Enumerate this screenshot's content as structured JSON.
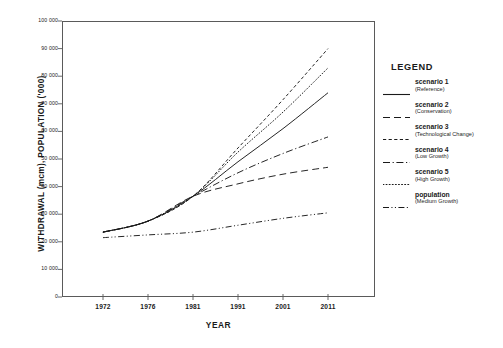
{
  "chart_data": {
    "type": "line",
    "title": "",
    "xlabel": "YEAR",
    "ylabel": "WITHDRAWAL (mcm), POPULATION ('000)",
    "x": [
      1972,
      1976,
      1981,
      1991,
      2001,
      2011
    ],
    "x_tick_labels": [
      "1972",
      "1976",
      "1981",
      "1991",
      "2001",
      "2011"
    ],
    "y_tick_labels": [
      "0",
      "10 000",
      "20 000",
      "30 000",
      "40 000",
      "50 000",
      "60 000",
      "70 000",
      "80 000",
      "90 000",
      "100 000"
    ],
    "y_tick_values": [
      0,
      10000,
      20000,
      30000,
      40000,
      50000,
      60000,
      70000,
      80000,
      90000,
      100000
    ],
    "ylim": [
      0,
      100000
    ],
    "grid": false,
    "legend_position": "right",
    "series": [
      {
        "name": "scenario 1",
        "sublabel": "(Reference)",
        "style": "solid",
        "values": [
          23500,
          27500,
          36500,
          49000,
          61000,
          74000
        ]
      },
      {
        "name": "scenario 2",
        "sublabel": "(Conservation)",
        "style": "long-dash",
        "values": [
          23500,
          27500,
          36500,
          41000,
          44500,
          47000
        ]
      },
      {
        "name": "scenario 3",
        "sublabel": "(Technological Change)",
        "style": "short-dash",
        "values": [
          23500,
          27500,
          36500,
          54000,
          71500,
          90000
        ]
      },
      {
        "name": "scenario 4",
        "sublabel": "(Low Growth)",
        "style": "dash-dot",
        "values": [
          23500,
          27500,
          36500,
          45000,
          52000,
          58000
        ]
      },
      {
        "name": "scenario 5",
        "sublabel": "(High Growth)",
        "style": "dotted",
        "values": [
          23500,
          27500,
          36500,
          52500,
          67000,
          83000
        ]
      },
      {
        "name": "population",
        "sublabel": "(Medium Growth)",
        "style": "dash-dot-dot",
        "values": [
          21500,
          22500,
          23500,
          26000,
          28500,
          30500
        ]
      }
    ],
    "colors": {
      "line": "#1a1a1a",
      "axis": "#5a5a5a",
      "background": "#ffffff"
    }
  },
  "legend": {
    "title": "LEGEND"
  }
}
